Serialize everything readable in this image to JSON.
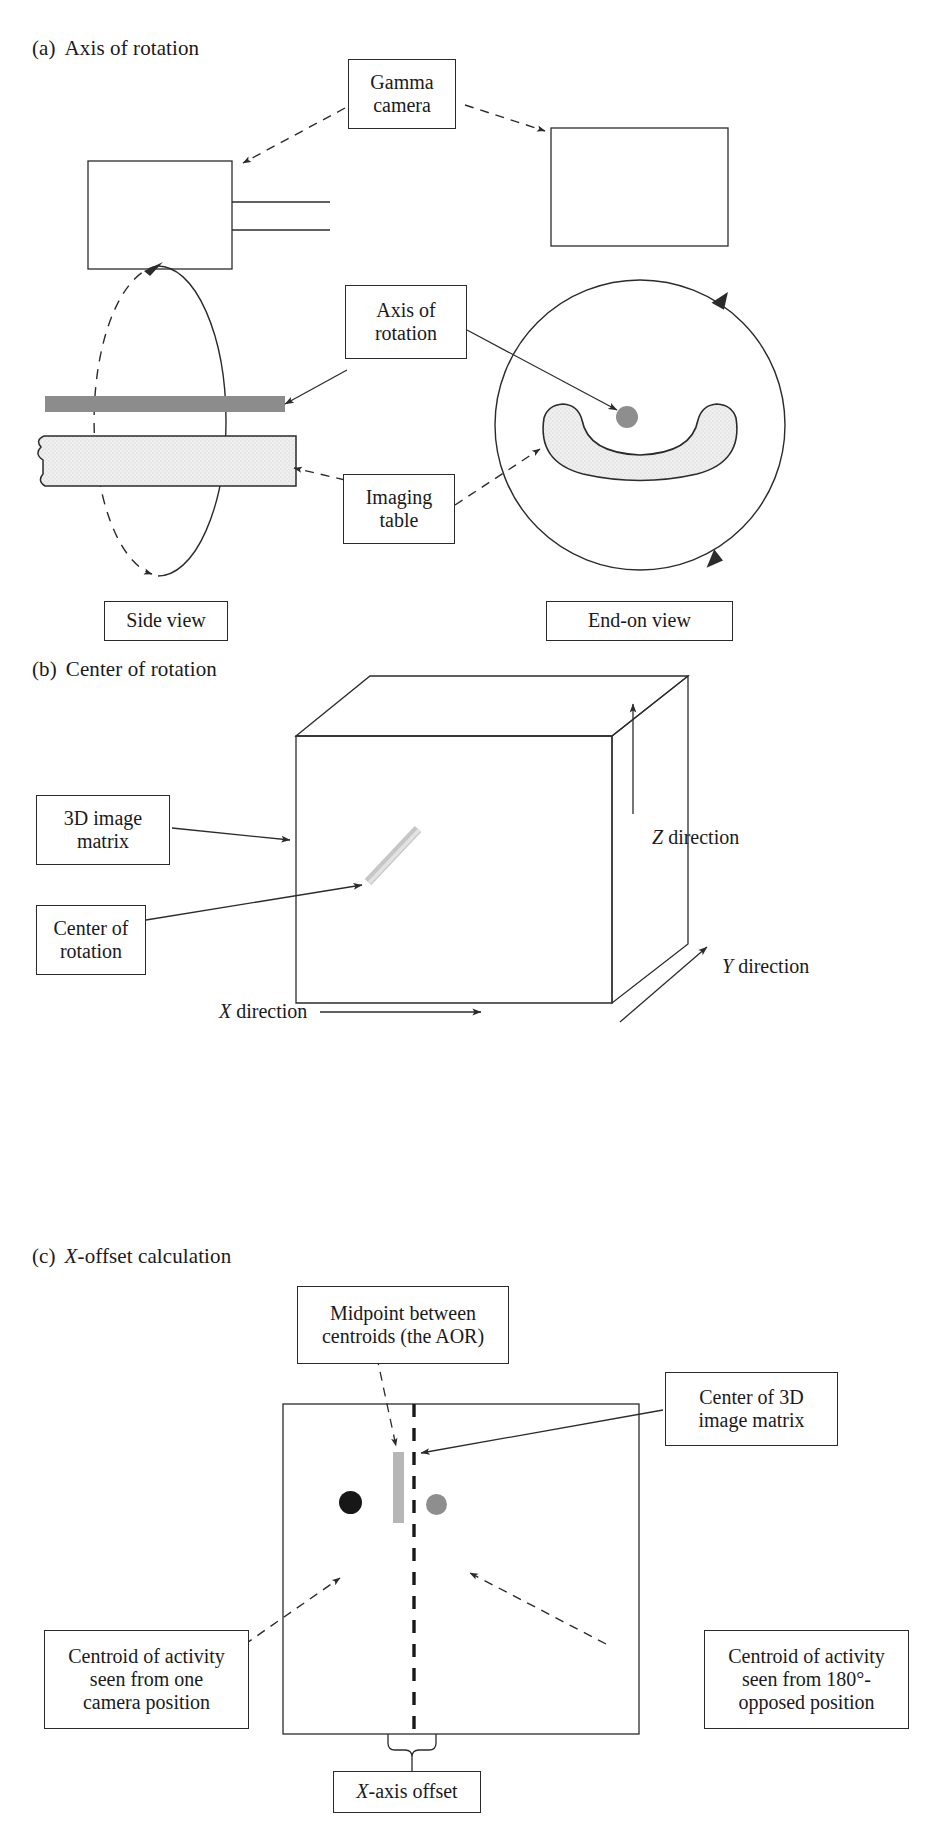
{
  "figure": {
    "panels": [
      {
        "id": "a",
        "tag": "(a)",
        "title": "Axis of rotation",
        "labels": {
          "gamma_camera": "Gamma\ncamera",
          "axis_of_rotation": "Axis of\nrotation",
          "imaging_table": "Imaging\ntable",
          "side_view": "Side view",
          "end_on_view": "End-on view"
        }
      },
      {
        "id": "b",
        "tag": "(b)",
        "title": "Center of rotation",
        "labels": {
          "image_matrix": "3D image\nmatrix",
          "center_of_rotation": "Center of\nrotation",
          "z_direction": "Z direction",
          "y_direction": "Y direction",
          "x_direction": "X direction"
        }
      },
      {
        "id": "c",
        "tag": "(c)",
        "title": "X-offset calculation",
        "title_italic_prefix": "X",
        "title_rest": "-offset calculation",
        "labels": {
          "midpoint": "Midpoint between\ncentroids (the AOR)",
          "center_3d_matrix": "Center of 3D\nimage matrix",
          "centroid_one": "Centroid of activity\nseen from one\ncamera position",
          "centroid_opposed": "Centroid of activity\nseen from 180°-\nopposed position",
          "x_axis_offset": "X-axis offset",
          "x_axis_offset_italic_prefix": "X",
          "x_axis_offset_rest": "-axis offset"
        }
      }
    ],
    "colors": {
      "stroke": "#2b2b2b",
      "axis_bar": "#8c8c8c",
      "table_fill": "#efefef",
      "centroid_dark": "#171717",
      "centroid_light": "#8e8e8e",
      "aor_marker": "#b6b6b6",
      "background": "#ffffff"
    }
  }
}
